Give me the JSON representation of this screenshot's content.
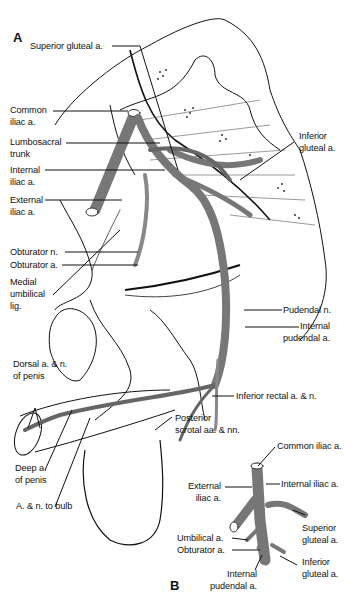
{
  "figure": {
    "panel_a": "A",
    "panel_b": "B",
    "colors": {
      "vessel": "#7a7a7a",
      "vessel_dark": "#555555",
      "line": "#111111",
      "bg": "#ffffff"
    }
  },
  "panel_a_labels": {
    "superior_gluteal": "Superior gluteal a.",
    "common_iliac": [
      "Common",
      "iliac a."
    ],
    "lumbosacral": [
      "Lumbosacral",
      "trunk"
    ],
    "internal_iliac": [
      "Internal",
      "iliac a."
    ],
    "external_iliac": [
      "External",
      "iliac a."
    ],
    "obturator_n": "Obturator n.",
    "obturator_a": "Obturator a.",
    "medial_umbilical": [
      "Medial",
      "umbilical",
      "lig."
    ],
    "inferior_gluteal": [
      "Inferior",
      "gluteal a."
    ],
    "pudendal_n": "Pudendal n.",
    "internal_pudendal": [
      "Internal",
      "pudendal a."
    ],
    "inferior_rectal": "Inferior rectal a. & n.",
    "dorsal_penis": [
      "Dorsal a. & n.",
      "of penis"
    ],
    "posterior_scrotal": [
      "Posterior",
      "scrotal aa. & nn."
    ],
    "deep_penis": [
      "Deep a.",
      "of penis"
    ],
    "bulb": "A. & n. to bulb"
  },
  "panel_b_labels": {
    "common_iliac": "Common iliac a.",
    "external_iliac": [
      "External",
      "iliac a."
    ],
    "internal_iliac": "Internal iliac a.",
    "superior_gluteal": [
      "Superior",
      "gluteal a."
    ],
    "umbilical": "Umbilical a.",
    "obturator": "Obturator a.",
    "inferior_gluteal": [
      "Inferior",
      "gluteal a."
    ],
    "internal_pudendal": [
      "Internal",
      "pudendal a."
    ]
  }
}
